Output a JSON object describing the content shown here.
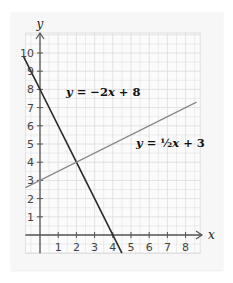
{
  "chart_data": {
    "type": "line",
    "title": "",
    "xlabel": "x",
    "ylabel": "y",
    "xlim": [
      -0.8,
      8.8
    ],
    "ylim": [
      -1,
      11
    ],
    "grid": true,
    "x_ticks": [
      1,
      2,
      3,
      4,
      5,
      6,
      7,
      8
    ],
    "y_ticks": [
      1,
      2,
      3,
      4,
      5,
      6,
      7,
      8,
      9,
      10
    ],
    "series": [
      {
        "name": "y = −2x + 8",
        "slope": -2,
        "intercept": 8,
        "color": "#2b2b2b",
        "x": [
          -0.9,
          4.5
        ],
        "y": [
          9.8,
          -1
        ]
      },
      {
        "name": "y = ½x + 3",
        "slope": 0.5,
        "intercept": 3,
        "color": "#8a8a8a",
        "x": [
          -0.8,
          8.6
        ],
        "y": [
          2.6,
          7.3
        ]
      }
    ],
    "annotations": [
      {
        "text": "y = −2x + 8",
        "x": 1.3,
        "y": 7.6
      },
      {
        "text": "y = ½x + 3",
        "x": 5.4,
        "y": 5.1
      }
    ],
    "intersection": {
      "x": 2,
      "y": 4
    }
  },
  "labels": {
    "x_axis": "x",
    "y_axis": "y",
    "eq1_prefix": "y",
    "eq1_rest": " = −2",
    "eq1_x": "x",
    "eq1_tail": " + 8",
    "eq2_prefix": "y",
    "eq2_rest": " = ½",
    "eq2_x": "x",
    "eq2_tail": " + 3",
    "xticks": [
      "1",
      "2",
      "3",
      "4",
      "5",
      "6",
      "7",
      "8"
    ],
    "yticks": [
      "1",
      "2",
      "3",
      "4",
      "5",
      "6",
      "7",
      "8",
      "9",
      "10"
    ]
  },
  "colors": {
    "paper": "#f7f7f7",
    "grid": "#dcdcdc",
    "axis": "#555555",
    "line1": "#2b2b2b",
    "line2": "#8a8a8a"
  }
}
